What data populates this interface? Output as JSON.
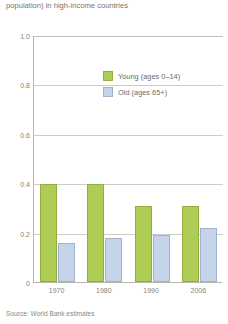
{
  "title": {
    "line_1": "dependency ratio (ratio of dependent to working-age",
    "line_2": "population) in high-income countries"
  },
  "legend": {
    "position": "inside-top-right",
    "items": [
      {
        "label": "Young (ages 0–14)",
        "color": "#afcc54",
        "swatch": "young"
      },
      {
        "label": "Old (ages 65+)",
        "color": "#c5d4e8",
        "swatch": "old"
      }
    ]
  },
  "source": {
    "text": "Source: World Bank estimates"
  },
  "chart_data": {
    "type": "bar",
    "title": "population) in high-income countries",
    "xlabel": "",
    "ylabel": "",
    "ylim": [
      0,
      1.0
    ],
    "yticks": [
      "0",
      "0.2",
      "0.4",
      "0.6",
      "0.8",
      "1.0"
    ],
    "ytick_values": [
      0,
      0.2,
      0.4,
      0.6,
      0.8,
      1.0
    ],
    "grid": true,
    "legend_position": "inside-top-right",
    "categories": [
      "1970",
      "1980",
      "1990",
      "2006"
    ],
    "series": [
      {
        "name": "Young (ages 0–14)",
        "color": "#afcc54",
        "values": [
          0.4,
          0.4,
          0.31,
          0.31
        ]
      },
      {
        "name": "Old (ages 65+)",
        "color": "#c5d4e8",
        "values": [
          0.16,
          0.18,
          0.19,
          0.22
        ]
      }
    ]
  }
}
